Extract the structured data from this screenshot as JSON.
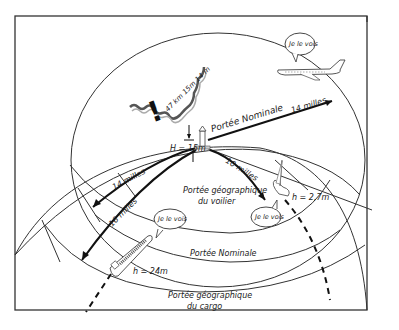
{
  "diagram": {
    "title_mark": "!",
    "colors": {
      "line": "#111111",
      "frame": "#333333",
      "background": "#ffffff",
      "shore_shading": "#999999"
    },
    "labels": {
      "coast_height": "47 km 15m 14 m",
      "lighthouse_height": "H = 15m",
      "nominal_range_top": "Portée Nominale",
      "nominal_range_top_distance": "14 milles",
      "sailboat_distance": "10 milles",
      "left_arrow_upper": "14 milles",
      "left_arrow_lower": "16 milles",
      "geo_range_sailboat_line1": "Portée géographique",
      "geo_range_sailboat_line2": "du voilier",
      "sailboat_height": "h = 2,7m",
      "cargo_height": "h = 24m",
      "nominal_range_bottom": "Portée Nominale",
      "geo_range_cargo_line1": "Portée géographique",
      "geo_range_cargo_line2": "du cargo"
    },
    "speech_bubbles": {
      "airplane": "Je le vois",
      "sailboat": "Je le vois",
      "cargo": "Je le vois",
      "left": "Je le vois"
    },
    "objects": [
      "lighthouse",
      "coastline",
      "airplane",
      "sailboat",
      "cargo-ship",
      "earth-curvature"
    ]
  }
}
